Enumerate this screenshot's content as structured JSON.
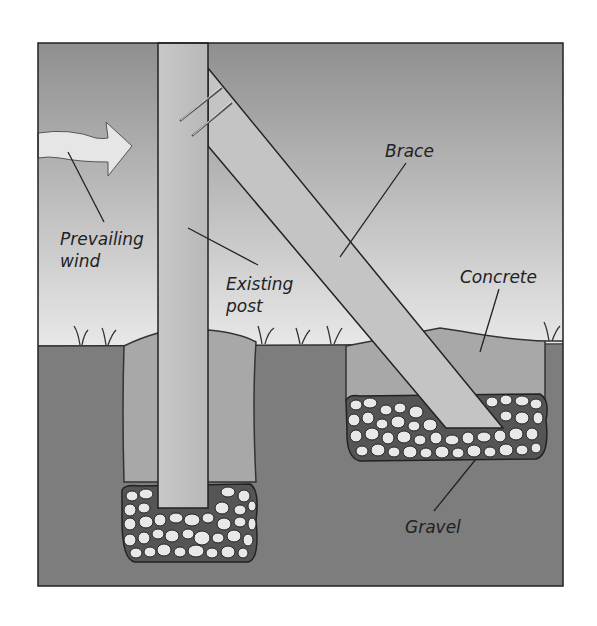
{
  "diagram": {
    "labels": {
      "wind": [
        "Prevailing",
        "wind"
      ],
      "post": [
        "Existing",
        "post"
      ],
      "brace": "Brace",
      "concrete": "Concrete",
      "gravel": "Gravel"
    },
    "colors": {
      "sky_top": "#8f8f8f",
      "sky_bottom": "#e6e6e6",
      "soil": "#7d7d7d",
      "concrete": "#a8a8a8",
      "wood": "#c4c4c4",
      "stone": "#e8e8e8",
      "outline": "#222222"
    }
  }
}
